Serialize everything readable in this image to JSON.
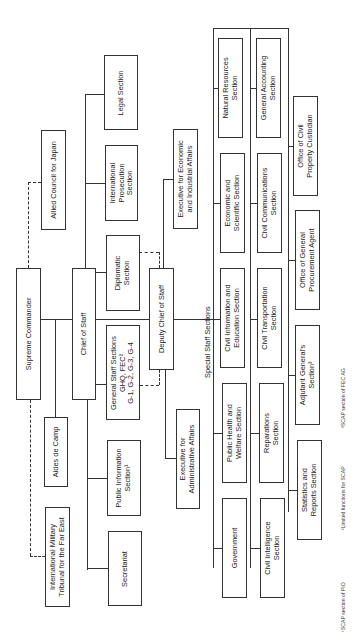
{
  "chart": {
    "orientation": "rotated-90-ccw",
    "boxes": {
      "supreme_commander": "Supreme Commander",
      "allied_council": "Allied Council for Japan",
      "aides_de_camp": "Aides de Camp",
      "imtfe": "International Military\nTribunal for the Far East",
      "chief_of_staff": "Chief of Staff",
      "legal_section": "Legal Section",
      "intl_prosecution": "International\nProsecution\nSection",
      "diplomatic": "Diplomatic\nSection",
      "general_staff": "General Staff Sections\nGHQ, FEC²\nG-1, G-2, G-3, G-4",
      "public_information": "Public Information\nSection¹",
      "secretariat": "Secretariat",
      "deputy_chief": "Deputy Chief of Staff",
      "exec_economic": "Executive for Economic\nand Industrial Affairs",
      "exec_admin": "Executive for\nAdministrative Affairs",
      "natural_resources": "Natural Resources\nSection",
      "econ_scientific": "Economic and\nScientific Section",
      "civil_info_edu": "Civil Information and\nEducation Section",
      "public_health": "Public Health and\nWelfare Section",
      "government": "Government",
      "general_accounting": "General Accounting\nSection",
      "civil_communications": "Civil Communications\nSection",
      "civil_transportation": "Civil Transportation\nSection",
      "reparations": "Reparations\nSection",
      "civil_intelligence": "Civil Intelligence\nSection",
      "civil_property": "Office of Civil\nProperty Custodian",
      "general_procurement": "Office of General\nProcurement Agent",
      "adjutant_general": "Adjutant General's\nSection³",
      "statistics_reports": "Statistics and\nReports Section"
    },
    "labels": {
      "special_staff": "Special Staff   Sections"
    },
    "footnotes": [
      "¹SCAP section of PIO",
      "²Limited functions for SCAP",
      "³SCAP section of FEC AG"
    ]
  }
}
